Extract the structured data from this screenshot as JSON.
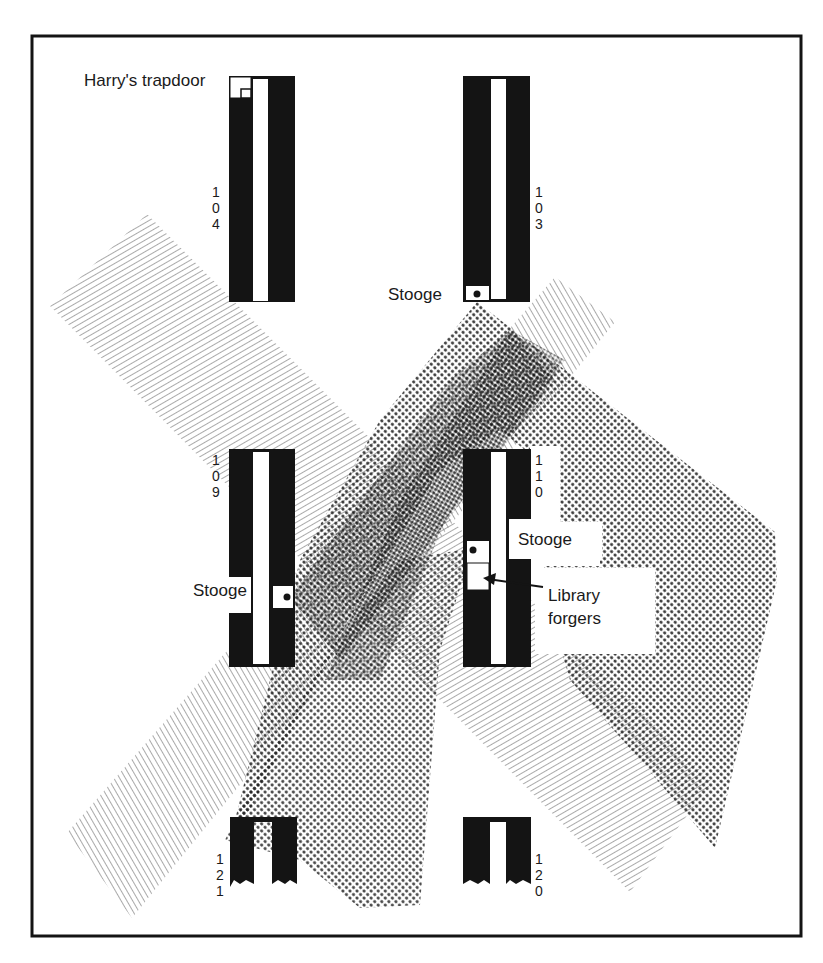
{
  "diagram": {
    "type": "floor-plan-surveillance",
    "colors": {
      "background": "#ffffff",
      "ink": "#141414",
      "hatch": "#8a8a8a",
      "dots": "#2a2a2a"
    },
    "frame": {
      "x": 31,
      "y": 35,
      "width": 771,
      "height": 902
    },
    "labels": {
      "harrys_trapdoor": "Harry's trapdoor",
      "stooge_103": "Stooge",
      "stooge_109": "Stooge",
      "stooge_110": "Stooge",
      "library_forgers_line1": "Library",
      "library_forgers_line2": "forgers"
    },
    "stacks": [
      {
        "id": "104",
        "digits": [
          "1",
          "0",
          "4"
        ]
      },
      {
        "id": "103",
        "digits": [
          "1",
          "0",
          "3"
        ]
      },
      {
        "id": "109",
        "digits": [
          "1",
          "0",
          "9"
        ]
      },
      {
        "id": "110",
        "digits": [
          "1",
          "1",
          "0"
        ]
      },
      {
        "id": "121",
        "digits": [
          "1",
          "2",
          "1"
        ]
      },
      {
        "id": "120",
        "digits": [
          "1",
          "2",
          "0"
        ]
      }
    ],
    "sight_lines": [
      {
        "name": "beam-left-hatched",
        "pattern": "hatch",
        "from": "upper-left",
        "to": "lower-right"
      },
      {
        "name": "beam-right-hatched",
        "pattern": "hatch",
        "from": "upper-right",
        "to": "lower-left"
      },
      {
        "name": "beam-stooge-103",
        "pattern": "dots",
        "origin": "Stooge at stack 103"
      },
      {
        "name": "beam-stooge-109",
        "pattern": "dots",
        "origin": "Stooge at stack 109"
      },
      {
        "name": "beam-stooge-110",
        "pattern": "dots",
        "origin": "Stooge at stack 110"
      }
    ]
  }
}
